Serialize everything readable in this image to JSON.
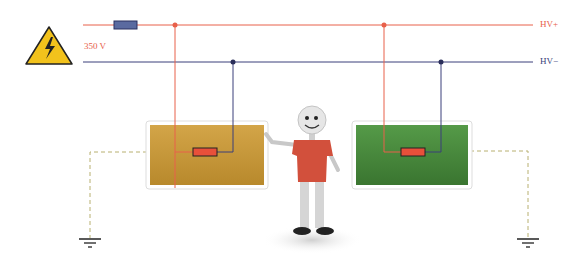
{
  "labels": {
    "voltage": "350 V",
    "hv_plus": "HV+",
    "hv_minus": "HV−"
  },
  "colors": {
    "hv_plus": "#e8604a",
    "hv_minus": "#3b3f7a",
    "left_box": "#c89a3a",
    "right_box": "#4a8a3e",
    "ground": "#b8b070",
    "fuse": "#5a6aa0",
    "resistor": "#e8503a",
    "warning": "#f2c21c"
  },
  "icons": {
    "warning": "high-voltage-warning-icon",
    "fuse": "fuse-icon",
    "ground": "ground-icon"
  }
}
